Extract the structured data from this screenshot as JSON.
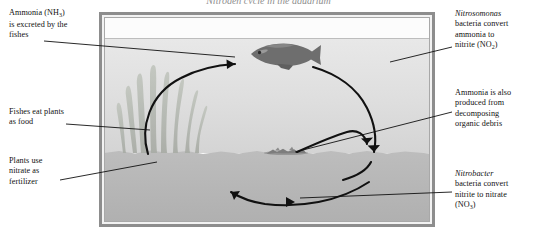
{
  "figure": {
    "title": "Nitrogen cycle in the aquarium",
    "type": "diagram"
  },
  "labels": {
    "ammonia_excreted": {
      "line1": "Ammonia (NH",
      "sub1": "3",
      "line1_end": ")",
      "line2": "is excreted by the",
      "line3": "fishes"
    },
    "fishes_eat": {
      "line1": "Fishes eat plants",
      "line2": "as food"
    },
    "plants_use": {
      "line1": "Plants use",
      "line2": "nitrate as",
      "line3": "fertilizer"
    },
    "nitrosomonas": {
      "species": "Nitrosomonas",
      "line2": "bacteria convert",
      "line3": "ammonia to",
      "line4_start": "nitrite (NO",
      "sub": "2",
      "line4_end": ")"
    },
    "ammonia_decomposing": {
      "line1": "Ammonia is also",
      "line2": "produced from",
      "line3": "decomposing",
      "line4": "organic debris"
    },
    "nitrobacter": {
      "species": "Nitrobacter",
      "line2": "bacteria convert",
      "line3": "nitrite to nitrate",
      "line4_start": "(NO",
      "sub": "3",
      "line4_end": ")"
    }
  },
  "scene": {
    "tank_frame_color": "#8d8d8d",
    "air_color": "#fcfcfc",
    "water_upper_color": "#e4e4e4",
    "water_lower_color": "#c9c9c9",
    "gravel_color": "#b4b4b4",
    "fish_color": "#6e6e6e",
    "plant_color": "#b9bdb6",
    "arrow_color": "#111111",
    "elements": [
      "fish",
      "aquatic-plants",
      "gravel-substrate",
      "organic-debris",
      "cycle-arrows"
    ]
  }
}
